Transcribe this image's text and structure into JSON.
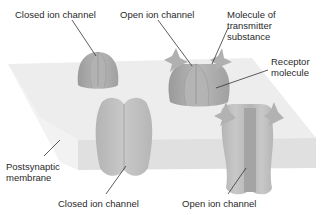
{
  "diagram": {
    "labels": {
      "closed_top": "Closed ion channel",
      "open_top": "Open ion channel",
      "transmitter": "Molecule of\ntransmitter\nsubstance",
      "receptor": "Receptor\nmolecule",
      "membrane": "Postsynaptic\nmembrane",
      "closed_bottom": "Closed ion channel",
      "open_bottom": "Open ion channel"
    },
    "colors": {
      "membrane_top": "#ececec",
      "membrane_front": "#dedede",
      "channel": "#a8a8a8",
      "channel_light": "#bdbdbd",
      "transmitter": "#b0b0b0",
      "leader_line": "#333333",
      "text": "#2a2a2a"
    }
  }
}
